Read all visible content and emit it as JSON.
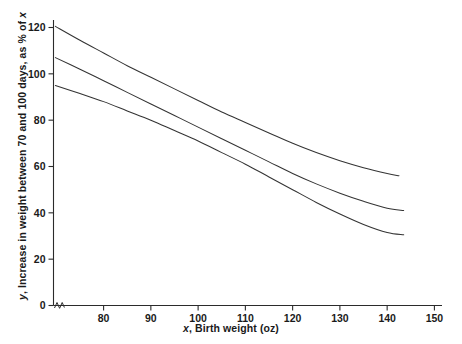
{
  "chart_data": {
    "type": "line",
    "title": "",
    "subtitle": "",
    "xlabel_prefix": "x",
    "xlabel": ", Birth weight (oz)",
    "ylabel_prefix": "y",
    "ylabel": ", Increase in weight between 70 and 100 days, as % of ",
    "ylabel_suffix": "x",
    "xlim": [
      69.4,
      151.5
    ],
    "ylim": [
      0,
      123
    ],
    "xticks": [
      80,
      90,
      100,
      110,
      120,
      130,
      140,
      150
    ],
    "yticks": [
      0,
      20,
      40,
      60,
      80,
      100,
      120
    ],
    "xtick_labels": [
      "80",
      "90",
      "100",
      "110",
      "120",
      "130",
      "140",
      "150"
    ],
    "ytick_labels": [
      "0",
      "20",
      "40",
      "60",
      "80",
      "100",
      "120"
    ],
    "grid": false,
    "legend": null,
    "axis_break": "x-axis origin break",
    "line_color": "#333333",
    "series": [
      {
        "name": "upper-confidence-curve",
        "points": [
          [
            69.8,
            120.5
          ],
          [
            75,
            114.5
          ],
          [
            80,
            109.0
          ],
          [
            85,
            103.5
          ],
          [
            90,
            98.5
          ],
          [
            95,
            93.5
          ],
          [
            100,
            88.5
          ],
          [
            105,
            83.5
          ],
          [
            110,
            79.0
          ],
          [
            115,
            74.5
          ],
          [
            120,
            70.0
          ],
          [
            125,
            66.0
          ],
          [
            130,
            62.5
          ],
          [
            135,
            59.5
          ],
          [
            140,
            57.0
          ],
          [
            142.5,
            56.0
          ]
        ]
      },
      {
        "name": "fitted-regression-curve",
        "points": [
          [
            69.8,
            107.0
          ],
          [
            75,
            102.0
          ],
          [
            80,
            97.0
          ],
          [
            85,
            92.0
          ],
          [
            90,
            87.0
          ],
          [
            95,
            82.0
          ],
          [
            100,
            77.0
          ],
          [
            105,
            72.0
          ],
          [
            110,
            67.0
          ],
          [
            115,
            62.0
          ],
          [
            120,
            57.0
          ],
          [
            125,
            52.5
          ],
          [
            130,
            48.5
          ],
          [
            135,
            45.0
          ],
          [
            140,
            42.0
          ],
          [
            143.5,
            41.0
          ]
        ]
      },
      {
        "name": "lower-confidence-curve",
        "points": [
          [
            69.8,
            95.0
          ],
          [
            75,
            91.5
          ],
          [
            80,
            88.0
          ],
          [
            85,
            84.0
          ],
          [
            90,
            80.0
          ],
          [
            95,
            75.5
          ],
          [
            100,
            71.0
          ],
          [
            105,
            66.0
          ],
          [
            110,
            61.0
          ],
          [
            115,
            55.5
          ],
          [
            120,
            50.0
          ],
          [
            125,
            44.5
          ],
          [
            130,
            39.5
          ],
          [
            135,
            35.0
          ],
          [
            140,
            31.5
          ],
          [
            143.5,
            30.5
          ]
        ]
      }
    ]
  }
}
